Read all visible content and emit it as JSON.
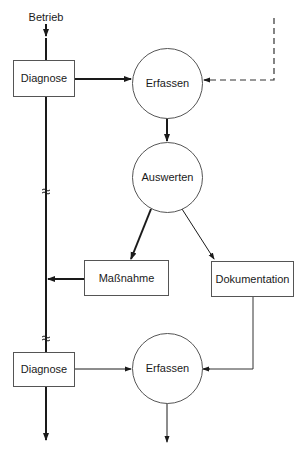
{
  "diagram": {
    "input_label": "Betrieb",
    "nodes": {
      "diagnose_top": {
        "label": "Diagnose",
        "shape": "rect"
      },
      "erfassen_top": {
        "label": "Erfassen",
        "shape": "circle"
      },
      "auswerten": {
        "label": "Auswerten",
        "shape": "circle"
      },
      "massnahme": {
        "label": "Maßnahme",
        "shape": "rect"
      },
      "dokumentation": {
        "label": "Dokumentation",
        "shape": "rect"
      },
      "diagnose_bottom": {
        "label": "Diagnose",
        "shape": "rect"
      },
      "erfassen_bottom": {
        "label": "Erfassen",
        "shape": "circle"
      }
    },
    "edges": [
      {
        "from": "Betrieb",
        "to": "diagnose_top",
        "style": "bold"
      },
      {
        "from": "diagnose_top",
        "to": "erfassen_top",
        "style": "bold"
      },
      {
        "from": "external",
        "to": "erfassen_top",
        "style": "dashed"
      },
      {
        "from": "erfassen_top",
        "to": "auswerten",
        "style": "bold"
      },
      {
        "from": "auswerten",
        "to": "massnahme",
        "style": "bold"
      },
      {
        "from": "auswerten",
        "to": "dokumentation",
        "style": "thin"
      },
      {
        "from": "massnahme",
        "to": "timeline",
        "style": "bold"
      },
      {
        "from": "diagnose_bottom",
        "to": "erfassen_bottom",
        "style": "thin"
      },
      {
        "from": "dokumentation",
        "to": "erfassen_bottom",
        "style": "thin"
      }
    ],
    "break_symbol": "≈",
    "colors": {
      "stroke": "#1a1a1a",
      "box_stroke": "#555555",
      "background": "#ffffff"
    }
  }
}
